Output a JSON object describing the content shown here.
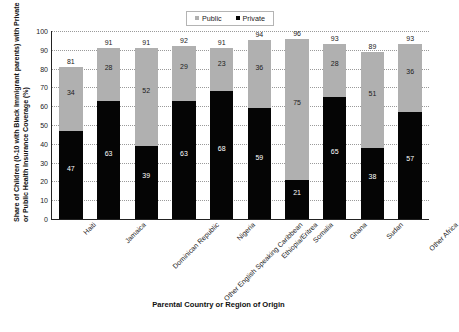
{
  "chart_data": {
    "type": "bar",
    "subtype": "stacked-bar",
    "title": "",
    "xlabel": "Parental Country or Region of Origin",
    "ylabel": "Share of Children (0-10 with Black Immigrant parents) with Private or Public Health Insurance Coverage (%)",
    "ylabel_line1": "Share of Children (0-10 with Black Immigrant parents) with Private",
    "ylabel_line2": "or Public Health Insurance Coverage (%)",
    "ylim": [
      0,
      100
    ],
    "yticks": [
      0,
      10,
      20,
      30,
      40,
      50,
      60,
      70,
      80,
      90,
      100
    ],
    "grid": true,
    "legend_position": "top-center",
    "categories": [
      "Haiti",
      "Jamaica",
      "Dominican Republic",
      "Other English Speaking Caribbean",
      "Nigeria",
      "Ethiopia/Eritrea",
      "Somalia",
      "Ghana",
      "Sudan",
      "Other Africa"
    ],
    "series": [
      {
        "name": "Private",
        "color": "#050505",
        "values": [
          47,
          63,
          39,
          63,
          68,
          59,
          21,
          65,
          38,
          57
        ]
      },
      {
        "name": "Public",
        "color": "#b0b0b0",
        "values": [
          34,
          28,
          52,
          29,
          23,
          36,
          75,
          28,
          51,
          36
        ]
      }
    ],
    "totals": [
      81,
      91,
      91,
      92,
      91,
      94,
      96,
      93,
      89,
      93
    ]
  },
  "legend": {
    "items": [
      {
        "label": "Public",
        "color": "#b0b0b0"
      },
      {
        "label": "Private",
        "color": "#050505"
      }
    ]
  },
  "axes": {
    "y_title_line1": "Share of Children (0-10 with Black Immigrant parents) with Private",
    "y_title_line2": "or Public Health Insurance Coverage (%)",
    "x_title": "Parental Country or Region of Origin",
    "y_tick_labels": [
      "100",
      "90",
      "80",
      "70",
      "60",
      "50",
      "40",
      "30",
      "20",
      "10",
      "0"
    ]
  }
}
